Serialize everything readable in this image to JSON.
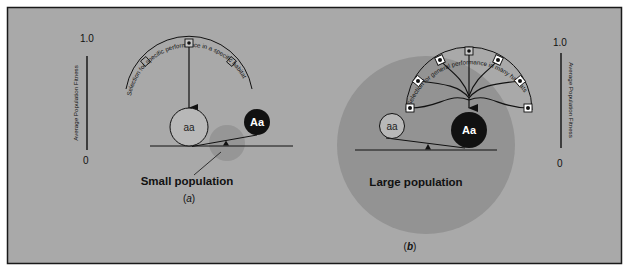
{
  "figure": {
    "colors": {
      "background": "#a9a9a9",
      "frame": "#1a1a1a",
      "population_blob": "#939393",
      "ink": "#111111",
      "dominant_fill": "#111111",
      "recessive_fill": "#b8b8b8"
    },
    "panel_a": {
      "label": "(a)",
      "label_italic": "a",
      "axis": {
        "top": "1.0",
        "bottom": "0",
        "title": "Average Population Fitness"
      },
      "arc_label": "Selection for specific performance in a specific habitat",
      "population_label": "Small population",
      "alleles": {
        "recessive": "aa",
        "dominant": "Aa"
      }
    },
    "panel_b": {
      "label": "(b)",
      "label_italic": "b",
      "axis": {
        "top": "1.0",
        "bottom": "0",
        "title": "Average Population Fitness"
      },
      "arc_label": "Selection for general performance in many habitats",
      "population_label": "Large population",
      "alleles": {
        "recessive": "aa",
        "dominant": "Aa"
      }
    }
  }
}
